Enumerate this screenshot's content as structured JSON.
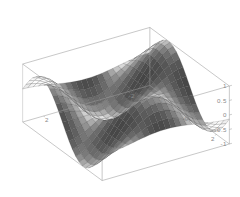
{
  "figure": {
    "kind": "surface-plot-3d",
    "background_color": "#ffffff",
    "frame_color": "#9a9a9a",
    "tick_label_color": "#8a8a8a",
    "mesh_line_color": "#4a4a4a",
    "surface_light_color": "#f0f0f0",
    "surface_dark_color": "#2e2e2e"
  },
  "chart_data": {
    "type": "surface",
    "title": "",
    "xlabel": "",
    "ylabel": "",
    "zlabel": "",
    "function": "sin(x) * cos(y)",
    "xlim": [
      -3,
      3
    ],
    "ylim": [
      -3,
      3
    ],
    "zlim": [
      -1,
      1
    ],
    "x_ticks": [
      -2,
      0,
      2
    ],
    "x_tick_labels": [
      "-2",
      "0",
      "2"
    ],
    "y_ticks": [
      -2,
      0,
      2
    ],
    "y_tick_labels": [
      "-2",
      "0",
      "2"
    ],
    "z_ticks": [
      -1,
      -0.5,
      0,
      0.5,
      1
    ],
    "z_tick_labels": [
      "-1",
      "-0.5",
      "0",
      "0.5",
      "1"
    ],
    "grid": true,
    "legend": null,
    "mesh_n": 24,
    "view": {
      "azimuth_deg": -58,
      "elevation_deg": 26,
      "projection": "orthographic"
    },
    "samples": {
      "x": [
        -3.0,
        -2.5,
        -2.0,
        -1.5,
        -1.0,
        -0.5,
        0.0,
        0.5,
        1.0,
        1.5,
        2.0,
        2.5,
        3.0
      ],
      "y": [
        -3.0,
        -2.5,
        -2.0,
        -1.5,
        -1.0,
        -0.5,
        0.0,
        0.5,
        1.0,
        1.5,
        2.0,
        2.5,
        3.0
      ],
      "z_rows": [
        [
          0.1397,
          0.1131,
          0.0587,
          -0.01,
          -0.0763,
          -0.1239,
          -0.1411,
          -0.1239,
          -0.0763,
          -0.01,
          0.0587,
          0.1131,
          0.1397
        ],
        [
          0.5925,
          0.4795,
          0.249,
          -0.0423,
          -0.3234,
          -0.5253,
          -0.5985,
          -0.5253,
          -0.3234,
          -0.0423,
          0.249,
          0.4795,
          0.5925
        ],
        [
          0.9002,
          0.7285,
          0.3783,
          -0.0643,
          -0.4913,
          -0.7981,
          -0.9093,
          -0.7981,
          -0.4913,
          -0.0643,
          0.3783,
          0.7285,
          0.9002
        ],
        [
          0.9874,
          0.7991,
          0.415,
          -0.0705,
          -0.5389,
          -0.8755,
          -0.9975,
          -0.8755,
          -0.5389,
          -0.0705,
          0.415,
          0.7991,
          0.9874
        ],
        [
          0.833,
          0.6741,
          0.3501,
          -0.0595,
          -0.4546,
          -0.7386,
          -0.8415,
          -0.7386,
          -0.4546,
          -0.0595,
          0.3501,
          0.6741,
          0.833
        ],
        [
          0.4744,
          0.3839,
          0.1994,
          -0.0339,
          -0.2589,
          -0.4207,
          -0.4794,
          -0.4207,
          -0.2589,
          -0.0339,
          0.1994,
          0.3839,
          0.4744
        ],
        [
          0.0,
          0.0,
          0.0,
          0.0,
          0.0,
          0.0,
          0.0,
          0.0,
          0.0,
          0.0,
          0.0,
          0.0,
          0.0
        ],
        [
          -0.4744,
          -0.3839,
          -0.1994,
          0.0339,
          0.2589,
          0.4207,
          0.4794,
          0.4207,
          0.2589,
          0.0339,
          -0.1994,
          -0.3839,
          -0.4744
        ],
        [
          -0.833,
          -0.6741,
          -0.3501,
          0.0595,
          0.4546,
          0.7386,
          0.8415,
          0.7386,
          0.4546,
          0.0595,
          -0.3501,
          -0.6741,
          -0.833
        ],
        [
          -0.9874,
          -0.7991,
          -0.415,
          0.0705,
          0.5389,
          0.8755,
          0.9975,
          0.8755,
          0.5389,
          0.0705,
          -0.415,
          -0.7991,
          -0.9874
        ],
        [
          -0.9002,
          -0.7285,
          -0.3783,
          0.0643,
          0.4913,
          0.7981,
          0.9093,
          0.7981,
          0.4913,
          0.0643,
          -0.3783,
          -0.7285,
          -0.9002
        ],
        [
          -0.5925,
          -0.4795,
          -0.249,
          0.0423,
          0.3234,
          0.5253,
          0.5985,
          0.5253,
          0.3234,
          0.0423,
          -0.249,
          -0.4795,
          -0.5925
        ],
        [
          -0.1397,
          -0.1131,
          -0.0587,
          0.01,
          0.0763,
          0.1239,
          0.1411,
          0.1239,
          0.0763,
          0.01,
          -0.0587,
          -0.1131,
          -0.1397
        ]
      ]
    }
  }
}
